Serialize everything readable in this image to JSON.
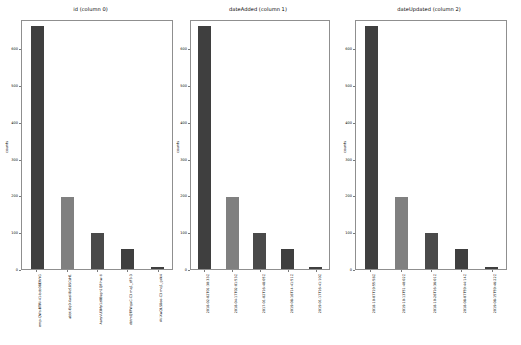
{
  "figure": {
    "background": "#ffffff",
    "panel_count": 3
  },
  "chart_data": [
    {
      "type": "bar",
      "title": "id (column 0)",
      "xlabel": "",
      "ylabel": "counts",
      "ylim": [
        0,
        680
      ],
      "yticks": [
        0,
        100,
        200,
        300,
        400,
        500,
        600
      ],
      "grid": false,
      "legend": "none",
      "categories": [
        "emp-QWs-BTRI-41-bcb08EWYG",
        "abbt-Eq0-Xwsl-Bz18SCsH1",
        "AaryVU3My1z0Bsgn1QF-hw-ti",
        "dbtmQTFWgaC-C3 mq1_cF3-3",
        "AV-XwQLS8oo-C3 mq1_gdk4"
      ],
      "values": [
        662,
        197,
        97,
        54,
        5
      ],
      "colors": [
        "#3f3f3f",
        "#808080",
        "#4a4a4a",
        "#3f3f3f",
        "#3f3f3f"
      ]
    },
    {
      "type": "bar",
      "title": "dateAdded (column 1)",
      "xlabel": "",
      "ylabel": "counts",
      "ylim": [
        0,
        680
      ],
      "yticks": [
        0,
        100,
        200,
        300,
        400,
        500,
        600
      ],
      "grid": false,
      "legend": "none",
      "categories": [
        "2018-02-02T01:30:33Z",
        "2018-04-17T02:01:53Z",
        "2017-01-02T16:48:05Z",
        "2019-08-16T14:41:51Z",
        "2019-01-17T16:41:10Z"
      ],
      "values": [
        662,
        197,
        97,
        54,
        5
      ],
      "colors": [
        "#3f3f3f",
        "#808080",
        "#4a4a4a",
        "#3f3f3f",
        "#3f3f3f"
      ]
    },
    {
      "type": "bar",
      "title": "dateUpdated (column 2)",
      "xlabel": "",
      "ylabel": "counts",
      "ylim": [
        0,
        680
      ],
      "yticks": [
        0,
        100,
        200,
        300,
        400,
        500,
        600
      ],
      "grid": false,
      "legend": "none",
      "categories": [
        "2018-10-07T19:55:58Z",
        "2019-10-13T51:40:02Z",
        "2018-10-26T16:36:01Z",
        "2018-08-07T59:44:14Z",
        "2019-08-15T59:46:22Z"
      ],
      "values": [
        662,
        197,
        97,
        54,
        5
      ],
      "colors": [
        "#3f3f3f",
        "#808080",
        "#4a4a4a",
        "#3f3f3f",
        "#3f3f3f"
      ]
    }
  ]
}
